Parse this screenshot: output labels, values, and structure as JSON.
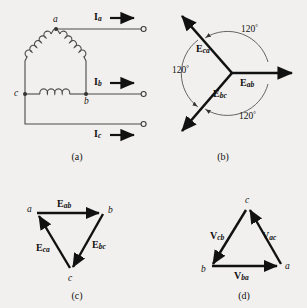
{
  "figure": {
    "background_color": "#f1f0ee",
    "line_color": "#3a3a3a",
    "vector_color": "#111111"
  },
  "panel_a": {
    "caption": "(a)",
    "description": "Delta-connected three-phase source with coil windings and three line terminals",
    "nodes": [
      {
        "label": "a"
      },
      {
        "label": "b"
      },
      {
        "label": "c"
      }
    ],
    "currents": [
      {
        "symbol": "I",
        "subscript": "a"
      },
      {
        "symbol": "I",
        "subscript": "b"
      },
      {
        "symbol": "I",
        "subscript": "c"
      }
    ]
  },
  "panel_b": {
    "caption": "(b)",
    "description": "Phasor diagram of line voltages separated by 120 degrees",
    "vectors": [
      {
        "symbol": "E",
        "subscript": "ab",
        "angle_deg": 0
      },
      {
        "symbol": "E",
        "subscript": "ca",
        "angle_deg": 120
      },
      {
        "symbol": "E",
        "subscript": "bc",
        "angle_deg": 240
      }
    ],
    "angles": [
      {
        "value": "120",
        "unit": "°"
      },
      {
        "value": "120",
        "unit": "°"
      },
      {
        "value": "120",
        "unit": "°"
      }
    ]
  },
  "panel_c": {
    "caption": "(c)",
    "description": "Closed phasor triangle of E voltages, vertices a, b, c",
    "nodes": [
      {
        "label": "a"
      },
      {
        "label": "b"
      },
      {
        "label": "c"
      }
    ],
    "vectors": [
      {
        "symbol": "E",
        "subscript": "ab"
      },
      {
        "symbol": "E",
        "subscript": "bc"
      },
      {
        "symbol": "E",
        "subscript": "ca"
      }
    ]
  },
  "panel_d": {
    "caption": "(d)",
    "description": "Closed phasor triangle of V voltages, vertices a, b, c",
    "nodes": [
      {
        "label": "c"
      },
      {
        "label": "b"
      },
      {
        "label": "a"
      }
    ],
    "vectors": [
      {
        "symbol": "V",
        "subscript": "cb"
      },
      {
        "symbol": "V",
        "subscript": "ac"
      },
      {
        "symbol": "V",
        "subscript": "ba"
      }
    ]
  }
}
